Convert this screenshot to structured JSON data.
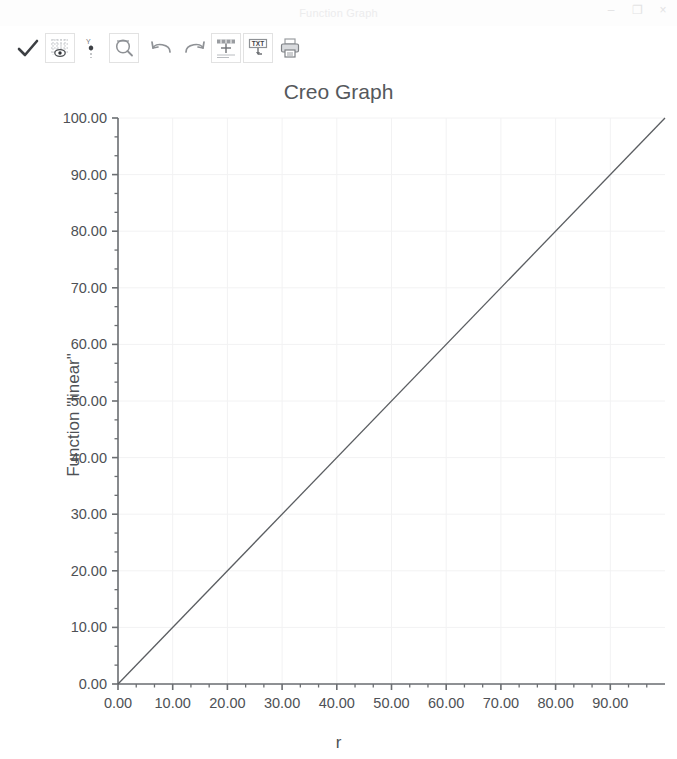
{
  "window": {
    "title": "Function Graph",
    "controls": [
      {
        "name": "minimize",
        "glyph": "–"
      },
      {
        "name": "maximize",
        "glyph": "❐"
      },
      {
        "name": "close",
        "glyph": "×"
      }
    ]
  },
  "toolbar": {
    "items": [
      {
        "icon": "check-icon",
        "label": "Accept",
        "framed": false,
        "active": false
      },
      {
        "icon": "graph-grid-icon",
        "label": "Show Grid",
        "framed": true,
        "active": true
      },
      {
        "icon": "axis-scale-icon",
        "label": "Axis Settings",
        "framed": false,
        "active": false
      },
      {
        "icon": "zoom-icon",
        "label": "Zoom",
        "framed": true,
        "active": false
      },
      {
        "icon": "undo-icon",
        "label": "Undo",
        "framed": false,
        "active": false
      },
      {
        "icon": "redo-icon",
        "label": "Redo",
        "framed": false,
        "active": false
      },
      {
        "icon": "table-icon",
        "label": "Show Table",
        "framed": true,
        "active": false
      },
      {
        "icon": "txt-export-icon",
        "label": "Export TXT",
        "framed": true,
        "active": false
      },
      {
        "icon": "print-icon",
        "label": "Print",
        "framed": false,
        "active": false
      }
    ]
  },
  "chart_data": {
    "type": "line",
    "title": "Creo Graph",
    "xlabel": "r",
    "ylabel": "Function \"linear\"",
    "xlim": [
      0,
      100
    ],
    "ylim": [
      0,
      100
    ],
    "grid": true,
    "legend": "none",
    "x_ticks": [
      "0.00",
      "10.00",
      "20.00",
      "30.00",
      "40.00",
      "50.00",
      "60.00",
      "70.00",
      "80.00",
      "90.00"
    ],
    "x_tick_values": [
      0,
      10,
      20,
      30,
      40,
      50,
      60,
      70,
      80,
      90
    ],
    "y_ticks": [
      "0.00",
      "10.00",
      "20.00",
      "30.00",
      "40.00",
      "50.00",
      "60.00",
      "70.00",
      "80.00",
      "90.00",
      "100.00"
    ],
    "y_tick_values": [
      0,
      10,
      20,
      30,
      40,
      50,
      60,
      70,
      80,
      90,
      100
    ],
    "x_minor_per_major": 2,
    "y_minor_per_major": 2,
    "series": [
      {
        "name": "linear",
        "color": "#5a5d61",
        "x": [
          0,
          100
        ],
        "values": [
          0,
          100
        ]
      }
    ]
  },
  "colors": {
    "axis": "#6b6e72",
    "grid": "#f2f2f3",
    "text": "#4e5155",
    "title": "#55585c",
    "line": "#5a5d61",
    "titlebar_text": "#ececed"
  }
}
